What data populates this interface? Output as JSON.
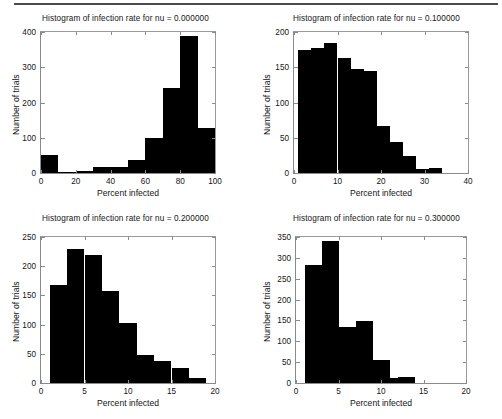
{
  "figure": {
    "background_color": "#ffffff",
    "bar_color": "#000000",
    "axis_color": "#8a8a8a",
    "scan_line_color": "#4a4a4a"
  },
  "panels": [
    {
      "id": "panel-nu-0",
      "title": "Histogram of infection rate for nu = 0.000000",
      "xlabel": "Percent infected",
      "ylabel": "Number of trials",
      "xticks": [
        "0",
        "20",
        "40",
        "60",
        "80",
        "100"
      ],
      "xtick_values": [
        0,
        20,
        40,
        60,
        80,
        100
      ],
      "yticks": [
        "0",
        "100",
        "200",
        "300",
        "400"
      ],
      "ytick_values": [
        0,
        100,
        200,
        300,
        400
      ]
    },
    {
      "id": "panel-nu-01",
      "title": "Histogram of infection rate for nu = 0.100000",
      "xlabel": "Percent infected",
      "ylabel": "Number of trials",
      "xticks": [
        "0",
        "10",
        "20",
        "30",
        "40"
      ],
      "xtick_values": [
        0,
        10,
        20,
        30,
        40
      ],
      "yticks": [
        "0",
        "50",
        "100",
        "150",
        "200"
      ],
      "ytick_values": [
        0,
        50,
        100,
        150,
        200
      ]
    },
    {
      "id": "panel-nu-02",
      "title": "Histogram of infection rate for nu = 0.200000",
      "xlabel": "Percent infected",
      "ylabel": "Number of trials",
      "xticks": [
        "0",
        "5",
        "10",
        "15",
        "20"
      ],
      "xtick_values": [
        0,
        5,
        10,
        15,
        20
      ],
      "yticks": [
        "0",
        "50",
        "100",
        "150",
        "200",
        "250"
      ],
      "ytick_values": [
        0,
        50,
        100,
        150,
        200,
        250
      ]
    },
    {
      "id": "panel-nu-03",
      "title": "Histogram of infection rate for nu = 0.300000",
      "xlabel": "Percent infected",
      "ylabel": "Number of trials",
      "xticks": [
        "0",
        "5",
        "10",
        "15",
        "20"
      ],
      "xtick_values": [
        0,
        5,
        10,
        15,
        20
      ],
      "yticks": [
        "0",
        "50",
        "100",
        "150",
        "200",
        "250",
        "300",
        "350"
      ],
      "ytick_values": [
        0,
        50,
        100,
        150,
        200,
        250,
        300,
        350
      ]
    }
  ],
  "chart_data": [
    {
      "type": "bar",
      "id": "panel-nu-0",
      "title": "Histogram of infection rate for nu = 0.000000",
      "xlabel": "Percent infected",
      "ylabel": "Number of trials",
      "xlim": [
        0,
        100
      ],
      "ylim": [
        0,
        400
      ],
      "grid": false,
      "legend": null,
      "bin_edges": [
        0,
        10,
        20,
        30,
        40,
        50,
        60,
        70,
        80,
        90,
        100
      ],
      "categories": [
        "0-10",
        "10-20",
        "20-30",
        "30-40",
        "40-50",
        "50-60",
        "60-70",
        "70-80",
        "80-90",
        "90-100"
      ],
      "values": [
        52,
        2,
        5,
        16,
        18,
        38,
        98,
        242,
        389,
        127
      ]
    },
    {
      "type": "bar",
      "id": "panel-nu-01",
      "title": "Histogram of infection rate for nu = 0.100000",
      "xlabel": "Percent infected",
      "ylabel": "Number of trials",
      "xlim": [
        0,
        40
      ],
      "ylim": [
        0,
        200
      ],
      "grid": false,
      "legend": null,
      "bin_edges": [
        1,
        4,
        7,
        10,
        13,
        16,
        19,
        22,
        25,
        28,
        31,
        34
      ],
      "categories": [
        "1-4",
        "4-7",
        "7-10",
        "10-13",
        "13-16",
        "16-19",
        "19-22",
        "22-25",
        "25-28",
        "28-31",
        "31-34"
      ],
      "values": [
        174,
        177,
        185,
        163,
        147,
        145,
        67,
        44,
        24,
        5,
        7
      ]
    },
    {
      "type": "bar",
      "id": "panel-nu-02",
      "title": "Histogram of infection rate for nu = 0.200000",
      "xlabel": "Percent infected",
      "ylabel": "Number of trials",
      "xlim": [
        0,
        20
      ],
      "ylim": [
        0,
        250
      ],
      "grid": false,
      "legend": null,
      "bin_edges": [
        1,
        3,
        5,
        7,
        9,
        11,
        13,
        15,
        17,
        19
      ],
      "categories": [
        "1-3",
        "3-5",
        "5-7",
        "7-9",
        "9-11",
        "11-13",
        "13-15",
        "15-17",
        "17-19"
      ],
      "values": [
        167,
        229,
        219,
        157,
        102,
        48,
        38,
        26,
        8
      ]
    },
    {
      "type": "bar",
      "id": "panel-nu-03",
      "title": "Histogram of infection rate for nu = 0.300000",
      "xlabel": "Percent infected",
      "ylabel": "Number of trials",
      "xlim": [
        0,
        20
      ],
      "ylim": [
        0,
        350
      ],
      "grid": false,
      "legend": null,
      "bin_edges": [
        1,
        2,
        3,
        4,
        5,
        6,
        7,
        8,
        9,
        10,
        11,
        12,
        13,
        14,
        15,
        16,
        17
      ],
      "categories": [
        "1-2",
        "2-3",
        "3-4",
        "4-5",
        "5-6",
        "6-7",
        "7-8",
        "8-9",
        "9-10",
        "10-11",
        "11-12",
        "12-13",
        "13-14",
        "14-15",
        "15-16",
        "16-17"
      ],
      "values": [
        283,
        283,
        341,
        341,
        135,
        135,
        149,
        149,
        55,
        55,
        11,
        14,
        14,
        1,
        1,
        1
      ]
    }
  ]
}
